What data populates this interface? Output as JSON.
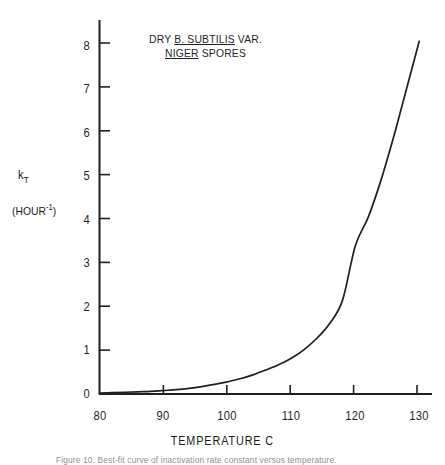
{
  "figure": {
    "title_line1_prefix": "DRY ",
    "title_line1_underlined": "B. SUBTILIS",
    "title_line1_suffix": " VAR.",
    "title_line2_underlined": "NIGER",
    "title_line2_suffix": " SPORES",
    "caption": "Figure 10.  Best-fit curve of inactivation rate constant versus temperature.",
    "ink_color": "#1f1f1f",
    "background_color": "#ffffff"
  },
  "axis": {
    "y_symbol": "k",
    "y_subscript": "T",
    "y_units_open": "(HOUR",
    "y_units_exponent": "-1",
    "y_units_close": ")",
    "x_title": "TEMPERATURE  C"
  },
  "chart_data": {
    "type": "line",
    "title": "DRY B. SUBTILIS VAR. NIGER SPORES",
    "xlabel": "TEMPERATURE  C",
    "ylabel": "k_T (HOUR^-1)",
    "xlim": [
      80,
      132
    ],
    "ylim": [
      0,
      8.6
    ],
    "xticks": [
      80,
      90,
      100,
      110,
      120,
      130
    ],
    "xtick_labels": [
      "80",
      "90",
      "100",
      "110",
      "120",
      "130"
    ],
    "yticks": [
      0,
      1,
      2,
      3,
      4,
      5,
      6,
      7,
      8
    ],
    "ytick_labels": [
      "0",
      "1",
      "2",
      "3",
      "4",
      "5",
      "6",
      "7",
      "8"
    ],
    "grid": false,
    "legend": null,
    "series": [
      {
        "name": "k_T vs temperature",
        "x": [
          80,
          82,
          84,
          86,
          88,
          90,
          92,
          94,
          96,
          98,
          100,
          102,
          104,
          106,
          108,
          110,
          112,
          114,
          116,
          118,
          120,
          122,
          124,
          126,
          128,
          130
        ],
        "y": [
          0.02,
          0.03,
          0.04,
          0.05,
          0.06,
          0.08,
          0.1,
          0.13,
          0.17,
          0.22,
          0.28,
          0.35,
          0.44,
          0.55,
          0.67,
          0.82,
          1.02,
          1.28,
          1.62,
          2.15,
          3.4,
          4.05,
          4.9,
          5.9,
          7.0,
          8.1
        ]
      }
    ]
  }
}
